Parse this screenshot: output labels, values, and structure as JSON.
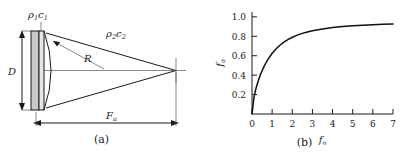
{
  "figure": {
    "panel_a": {
      "caption": "(a)",
      "labels": {
        "medium1": {
          "rho": "ρ",
          "rho_sub": "1",
          "c": "c",
          "c_sub": "1"
        },
        "medium2": {
          "rho": "ρ",
          "rho_sub": "2",
          "c": "c",
          "c_sub": "2"
        },
        "diameter": "D",
        "radius": "R",
        "focal_length": "F",
        "focal_length_sub": "a"
      }
    },
    "panel_b": {
      "caption": "(b)"
    }
  },
  "chart_data": {
    "type": "line",
    "title": "",
    "xlabel": "f",
    "xlabel_sub": "o",
    "ylabel": "f",
    "ylabel_sub": "a",
    "xlim": [
      0,
      7
    ],
    "ylim": [
      0,
      1.05
    ],
    "grid": false,
    "legend": null,
    "xticks": [
      0,
      1,
      2,
      3,
      4,
      5,
      6,
      7
    ],
    "xticklabels": [
      "0",
      "1",
      "2",
      "3",
      "4",
      "5",
      "6",
      "7"
    ],
    "yticks": [
      0.2,
      0.4,
      0.6,
      0.8,
      1.0
    ],
    "yticklabels": [
      "0.2",
      "0.4",
      "0.6",
      "0.8",
      "1.0"
    ],
    "series": [
      {
        "name": "fa",
        "x": [
          0.0,
          0.1,
          0.2,
          0.3,
          0.4,
          0.5,
          0.6,
          0.7,
          0.8,
          0.9,
          1.0,
          1.2,
          1.4,
          1.6,
          1.8,
          2.0,
          2.25,
          2.5,
          2.75,
          3.0,
          3.5,
          4.0,
          4.5,
          5.0,
          5.5,
          6.0,
          6.5,
          7.0
        ],
        "y": [
          0.0,
          0.175,
          0.265,
          0.335,
          0.395,
          0.445,
          0.49,
          0.53,
          0.565,
          0.595,
          0.625,
          0.672,
          0.71,
          0.742,
          0.768,
          0.79,
          0.812,
          0.83,
          0.845,
          0.857,
          0.876,
          0.89,
          0.9,
          0.908,
          0.914,
          0.919,
          0.923,
          0.927
        ]
      }
    ]
  }
}
